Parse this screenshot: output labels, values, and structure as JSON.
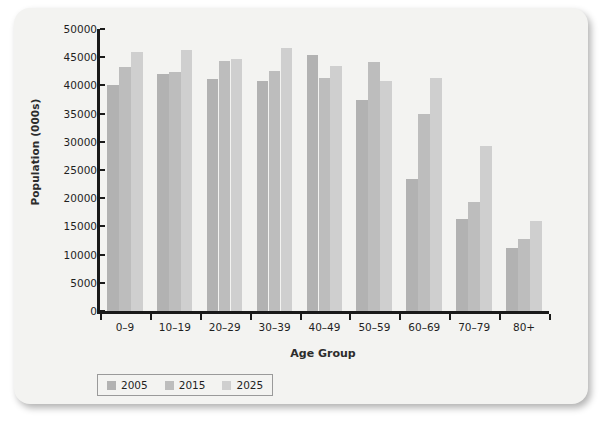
{
  "chart_data": {
    "type": "bar",
    "title": "",
    "xlabel": "Age Group",
    "ylabel": "Population (000s)",
    "ylim": [
      0,
      50000
    ],
    "ytick_step": 5000,
    "yticks": [
      0,
      5000,
      10000,
      15000,
      20000,
      25000,
      30000,
      35000,
      40000,
      45000,
      50000
    ],
    "grid": false,
    "legend_position": "bottom-left",
    "categories": [
      "0–9",
      "10–19",
      "20–29",
      "30–39",
      "40–49",
      "50–59",
      "60–69",
      "70–79",
      "80+"
    ],
    "series": [
      {
        "name": "2005",
        "color": "#b2b2b2",
        "values": [
          40100,
          42100,
          41100,
          40800,
          45400,
          37500,
          23400,
          16300,
          11200
        ]
      },
      {
        "name": "2015",
        "color": "#bdbdbd",
        "values": [
          43200,
          42300,
          44300,
          42600,
          41300,
          44100,
          34900,
          19400,
          12700
        ]
      },
      {
        "name": "2025",
        "color": "#cfcfcf",
        "values": [
          46000,
          46300,
          44700,
          46600,
          43500,
          40700,
          41400,
          29200,
          15900
        ]
      }
    ]
  },
  "axes": {
    "y_title": "Population (000s)",
    "x_title": "Age Group"
  },
  "legend": {
    "entries": [
      {
        "label": "2005",
        "color": "#b2b2b2"
      },
      {
        "label": "2015",
        "color": "#bdbdbd"
      },
      {
        "label": "2025",
        "color": "#cfcfcf"
      }
    ]
  },
  "colors": {
    "card_background": "#f3f3f1",
    "axis": "#1a1a1a",
    "text": "#1f1f1f",
    "legend_border": "#9a9a9a"
  }
}
